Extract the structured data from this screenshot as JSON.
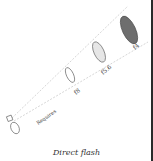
{
  "diagram": {
    "caption": "Direct flash",
    "distance_label": "Requires",
    "apertures": [
      {
        "label": "f8",
        "fill": "#ffffff"
      },
      {
        "label": "f5.6",
        "fill": "#e6e6e6"
      },
      {
        "label": "f4",
        "fill": "#6e6e6e"
      }
    ],
    "colors": {
      "line": "#bbbbbb",
      "outline": "#555555",
      "edge": "#2a2a2a"
    }
  }
}
